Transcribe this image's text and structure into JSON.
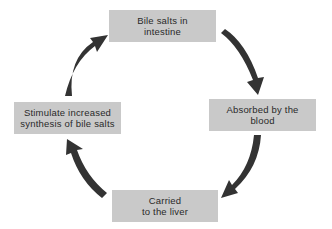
{
  "diagram": {
    "type": "cycle",
    "nodes": [
      {
        "id": "top",
        "lines": [
          "Bile salts in",
          "intestine"
        ]
      },
      {
        "id": "right",
        "lines": [
          "Absorbed by the",
          "blood"
        ]
      },
      {
        "id": "bottom",
        "lines": [
          "Carried",
          "to the liver"
        ]
      },
      {
        "id": "left",
        "lines": [
          "Stimulate increased",
          "synthesis of bile salts"
        ]
      }
    ],
    "edges": [
      {
        "from": "top",
        "to": "right",
        "direction": "clockwise"
      },
      {
        "from": "right",
        "to": "bottom",
        "direction": "clockwise"
      },
      {
        "from": "bottom",
        "to": "left",
        "direction": "clockwise"
      },
      {
        "from": "left",
        "to": "top",
        "direction": "clockwise"
      }
    ],
    "colors": {
      "box_fill": "#c9c9c9",
      "arrow": "#333333",
      "text": "#2a2a2a"
    }
  }
}
